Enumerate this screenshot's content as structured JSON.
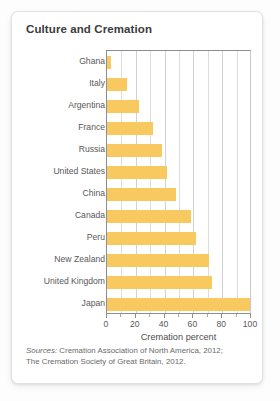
{
  "card": {
    "title": "Culture and Cremation"
  },
  "sources": {
    "lead": "Sources:",
    "line1": " Cremation Association of North America, 2012;",
    "line2": "The Cremation Society of Great Britain, 2012."
  },
  "chart_data": {
    "type": "bar",
    "orientation": "horizontal",
    "title": "Culture and Cremation",
    "categories": [
      "Ghana",
      "Italy",
      "Argentina",
      "France",
      "Russia",
      "United States",
      "China",
      "Canada",
      "Peru",
      "New Zealand",
      "United Kingdom",
      "Japan"
    ],
    "values": [
      3,
      14,
      22,
      32,
      38,
      42,
      48,
      58,
      62,
      71,
      73,
      99
    ],
    "xlabel": "Cremation percent",
    "ylabel": "",
    "xlim": [
      0,
      100
    ],
    "xticks": [
      0,
      20,
      40,
      60,
      80,
      100
    ],
    "xtick_labels": [
      "0",
      "20",
      "40",
      "60",
      "80",
      "100"
    ],
    "minor_tick_step": 10,
    "grid": "vertical",
    "legend": "none",
    "bar_color": "#F7C95E",
    "axis_color": "#8D8D8D",
    "grid_color": "#DCDCDC"
  }
}
